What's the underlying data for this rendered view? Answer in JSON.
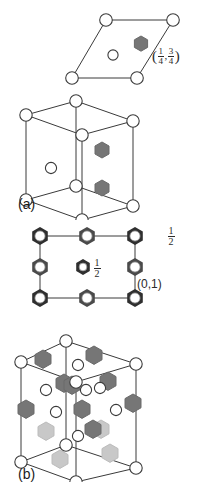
{
  "figure": {
    "background_color": "#ffffff",
    "width": 205,
    "height": 495
  },
  "colors": {
    "line": "#3a3a3a",
    "atom_open_fill": "#ffffff",
    "atom_open_stroke": "#3a3a3a",
    "hex_dark_fill": "#767676",
    "hex_dark_stroke": "#6a6a6a",
    "hex_light_fill": "#c8c8c8",
    "hex_light_stroke": "#bcbcbc",
    "hex_outline_stroke": "#2a2a2a",
    "text": "#1a1a1a"
  },
  "panels": [
    {
      "id": "panel-a",
      "label": "(a)",
      "subfigures": [
        {
          "id": "a-2d-cell",
          "type": "rhombus-projection",
          "description": "two dimensional rhombic unit cell projection",
          "corner_atoms": 4,
          "interior_open_atoms": 1,
          "interior_filled_hexagons": 1,
          "annotation": {
            "open_paren": "(",
            "close_paren": ")",
            "comma": ",",
            "fraction_1_num": "1",
            "fraction_1_den": "4",
            "fraction_2_num": "3",
            "fraction_2_den": "4"
          }
        },
        {
          "id": "a-3d-cell",
          "type": "rhombohedral-cell",
          "description": "three dimensional hexagonal prism unit cell",
          "vertex_atoms": 8,
          "filled_hexagons": 2,
          "interior_open_atoms": 1
        }
      ]
    },
    {
      "id": "panel-b",
      "label": "(b)",
      "subfigures": [
        {
          "id": "b-2d-cell",
          "type": "square-projection",
          "description": "two dimensional square unit cell projection with hexagonal site markers",
          "grid_sites": 8,
          "center_site": 1,
          "labels": {
            "top_right_height_num": "1",
            "top_right_height_den": "2",
            "center_height_num": "1",
            "center_height_den": "2",
            "edge_height": "(0,1)"
          }
        },
        {
          "id": "b-3d-cell",
          "type": "complex-cell",
          "description": "three dimensional unit cell with dark and light hexagonal atoms and open circle atoms",
          "vertex_atoms": 8,
          "dark_hexagons": 9,
          "light_hexagons": 4,
          "open_atoms": 9
        }
      ]
    }
  ]
}
